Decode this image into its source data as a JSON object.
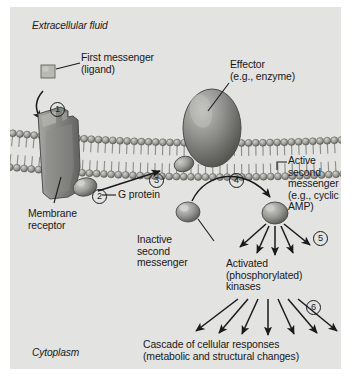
{
  "figure": {
    "background_color": "#e3e3e1",
    "ink_color": "#18181a"
  },
  "compartments": {
    "top_label": "Extracellular fluid",
    "bottom_label": "Cytoplasm"
  },
  "labels": {
    "first_messenger": "First messenger\n(ligand)",
    "effector": "Effector\n(e.g., enzyme)",
    "g_protein": "G protein",
    "membrane_receptor": "Membrane\nreceptor",
    "inactive_second_messenger": "Inactive\nsecond\nmessenger",
    "active_second_messenger": "Active\nsecond\nmessenger\n(e.g., cyclic\nAMP)",
    "activated_kinases": "Activated\n(phosphorylated)\nkinases",
    "cascade": "Cascade of cellular responses\n(metabolic and structural changes)"
  },
  "steps": [
    {
      "id": "1",
      "glyph": "①",
      "number": "1",
      "description": "Ligand binds membrane receptor"
    },
    {
      "id": "2",
      "glyph": "②",
      "number": "2",
      "description": "G protein activated at receptor"
    },
    {
      "id": "3",
      "glyph": "③",
      "number": "3",
      "description": "G protein activates effector enzyme"
    },
    {
      "id": "4",
      "glyph": "④",
      "number": "4",
      "description": "Inactive second messenger converted to active second messenger"
    },
    {
      "id": "5",
      "glyph": "⑤",
      "number": "5",
      "description": "Active second messenger activates kinases"
    },
    {
      "id": "6",
      "glyph": "⑥",
      "number": "6",
      "description": "Kinases trigger cascade of cellular responses"
    }
  ],
  "structures": {
    "ligand": "ligand-square",
    "receptor": "membrane-receptor-protein",
    "g_protein": "g-protein-subunit",
    "effector": "effector-enzyme-ellipse",
    "inactive_messenger": "inactive-second-messenger-sphere",
    "active_messenger": "active-second-messenger-sphere",
    "membrane": "phospholipid-bilayer"
  }
}
